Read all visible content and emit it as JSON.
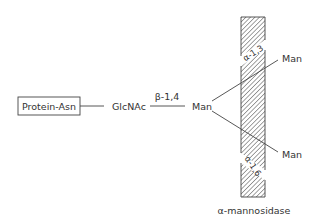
{
  "diagram": {
    "type": "glycan-structure",
    "nodes": {
      "protein": "Protein-Asn",
      "glcnac": "GlcNAc",
      "man_core": "Man",
      "man_upper": "Man",
      "man_lower": "Man"
    },
    "linkages": {
      "glcnac_man": "β-1,4",
      "upper_branch": "α-1,3",
      "lower_branch": "α-1,6"
    },
    "enzyme": {
      "label": "α-mannosidase"
    },
    "colors": {
      "line": "#444444",
      "text": "#333333",
      "hatch": "#555555",
      "background": "#ffffff"
    }
  }
}
